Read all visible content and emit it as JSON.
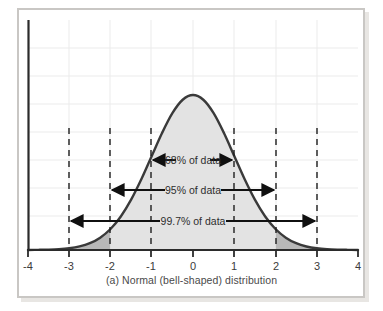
{
  "figure": {
    "caption": "(a) Normal (bell-shaped) distribution"
  },
  "chart_data": {
    "type": "line",
    "title": "(a) Normal (bell-shaped) distribution",
    "xlabel": "",
    "ylabel": "",
    "xlim": [
      -4,
      4
    ],
    "ylim": [
      0,
      0.42
    ],
    "grid": true,
    "legend_position": "none",
    "distribution": "standard normal (mean 0, standard deviation 1)",
    "x_ticks": [
      "-4",
      "-3",
      "-2",
      "-1",
      "0",
      "1",
      "2",
      "3",
      "4"
    ],
    "x_tick_values": [
      -4,
      -3,
      -2,
      -1,
      0,
      1,
      2,
      3,
      4
    ],
    "dashed_gridline_positions": [
      -3,
      -2,
      -1,
      1,
      2,
      3
    ],
    "curve": {
      "name": "standard normal density",
      "x": [
        -4,
        -3.75,
        -3.5,
        -3.25,
        -3,
        -2.75,
        -2.5,
        -2.25,
        -2,
        -1.75,
        -1.5,
        -1.25,
        -1,
        -0.75,
        -0.5,
        -0.25,
        0,
        0.25,
        0.5,
        0.75,
        1,
        1.25,
        1.5,
        1.75,
        2,
        2.25,
        2.5,
        2.75,
        3,
        3.25,
        3.5,
        3.75,
        4
      ],
      "y": [
        0.0001,
        0.0004,
        0.0009,
        0.002,
        0.0044,
        0.0091,
        0.0175,
        0.0317,
        0.054,
        0.0863,
        0.1295,
        0.1826,
        0.242,
        0.3011,
        0.3521,
        0.3867,
        0.3989,
        0.3867,
        0.3521,
        0.3011,
        0.242,
        0.1826,
        0.1295,
        0.0863,
        0.054,
        0.0317,
        0.0175,
        0.0091,
        0.0044,
        0.002,
        0.0009,
        0.0004,
        0.0001
      ]
    },
    "shaded_regions": [
      {
        "name": "central-region",
        "from": -2,
        "to": 2,
        "color": "#e3e3e3"
      },
      {
        "name": "left-tail-region",
        "from": -4,
        "to": -2,
        "color": "#b8b8b8"
      },
      {
        "name": "right-tail-region",
        "from": 2,
        "to": 4,
        "color": "#b8b8b8"
      }
    ],
    "annotations": [
      {
        "id": "sd1",
        "label": "68% of data",
        "from": -1,
        "to": 1,
        "sigma": 1
      },
      {
        "id": "sd2",
        "label": "95% of data",
        "from": -2,
        "to": 2,
        "sigma": 2
      },
      {
        "id": "sd3",
        "label": "99.7% of data",
        "from": -3,
        "to": 3,
        "sigma": 3
      }
    ]
  },
  "colors": {
    "curve_stroke": "#3a3a3a",
    "fill_center": "#e3e3e3",
    "fill_tail": "#b8b8b8",
    "gridline": "#e9e9e9",
    "axis": "#2b2b2b",
    "dashed": "#1f1f1f",
    "frame": "#c9c7c4",
    "caption_text": "#4a4a4a"
  }
}
